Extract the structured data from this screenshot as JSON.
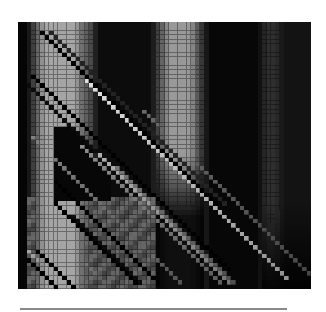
{
  "chart_data": {
    "type": "heatmap",
    "title": "",
    "xlabel": "",
    "ylabel": "",
    "colormap": "grayscale",
    "color_low": "#000000",
    "color_high": "#ffffff",
    "rows": 61,
    "cols": 66,
    "value_range": [
      0,
      1
    ],
    "column_bands": [
      {
        "col_start": 0,
        "col_end": 2,
        "value": 0.02
      },
      {
        "col_start": 3,
        "col_end": 4,
        "value": 0.35
      },
      {
        "col_start": 5,
        "col_end": 13,
        "value": 0.7
      },
      {
        "col_start": 14,
        "col_end": 16,
        "value": 0.4
      },
      {
        "col_start": 17,
        "col_end": 30,
        "value": 0.05
      },
      {
        "col_start": 31,
        "col_end": 32,
        "value": 0.35
      },
      {
        "col_start": 33,
        "col_end": 39,
        "value": 0.65
      },
      {
        "col_start": 40,
        "col_end": 41,
        "value": 0.3
      },
      {
        "col_start": 42,
        "col_end": 54,
        "value": 0.03
      },
      {
        "col_start": 55,
        "col_end": 58,
        "value": 0.2
      },
      {
        "col_start": 59,
        "col_end": 65,
        "value": 0.08
      }
    ],
    "band_fade": [
      {
        "col_start": 31,
        "col_end": 41,
        "fade_from_row": 30,
        "fade_to_row": 44
      },
      {
        "col_start": 55,
        "col_end": 65,
        "fade_from_row": 40,
        "fade_to_row": 60
      }
    ],
    "dark_wedge": {
      "row_start": 24,
      "row_end": 40,
      "col_start": 8,
      "col_end": 20,
      "value": 0.03
    },
    "lower_left_fill": {
      "row_start": 40,
      "row_end": 60,
      "col_start": 2,
      "col_end": 30,
      "value": 0.45
    },
    "diagonals": [
      {
        "row_start": 2,
        "col_start": 5,
        "length": 40,
        "value": 0.0,
        "style": "dark-checker"
      },
      {
        "row_start": 2,
        "col_start": 7,
        "length": 40,
        "value": 0.15,
        "style": "dark-checker"
      },
      {
        "row_start": 12,
        "col_start": 3,
        "length": 45,
        "value": 0.0,
        "style": "dark-checker"
      },
      {
        "row_start": 14,
        "col_start": 2,
        "length": 46,
        "value": 0.05,
        "style": "dark-checker"
      },
      {
        "row_start": 13,
        "col_start": 15,
        "length": 46,
        "value": 0.95,
        "style": "bright"
      },
      {
        "row_start": 15,
        "col_start": 17,
        "length": 44,
        "value": 0.55,
        "style": "bright"
      },
      {
        "row_start": 20,
        "col_start": 28,
        "length": 40,
        "value": 0.45,
        "style": "bright"
      },
      {
        "row_start": 26,
        "col_start": 3,
        "length": 34,
        "value": 0.55,
        "style": "bright"
      },
      {
        "row_start": 28,
        "col_start": 14,
        "length": 32,
        "value": 0.6,
        "style": "bright"
      },
      {
        "row_start": 30,
        "col_start": 18,
        "length": 30,
        "value": 0.75,
        "style": "bright"
      },
      {
        "row_start": 33,
        "col_start": 22,
        "length": 27,
        "value": 0.5,
        "style": "bright"
      },
      {
        "row_start": 36,
        "col_start": 8,
        "length": 24,
        "value": 0.0,
        "style": "dark-checker"
      },
      {
        "row_start": 41,
        "col_start": 8,
        "length": 19,
        "value": 0.0,
        "style": "dark-checker"
      },
      {
        "row_start": 44,
        "col_start": 12,
        "length": 16,
        "value": 0.05,
        "style": "dark-checker"
      },
      {
        "row_start": 52,
        "col_start": 2,
        "length": 9,
        "value": 0.7,
        "style": "bright"
      },
      {
        "row_start": 52,
        "col_start": 4,
        "length": 9,
        "value": 0.0,
        "style": "dark-checker"
      },
      {
        "row_start": 54,
        "col_start": 2,
        "length": 7,
        "value": 0.0,
        "style": "dark-checker"
      },
      {
        "row_start": 55,
        "col_start": 15,
        "length": 6,
        "value": 0.5,
        "style": "bright"
      }
    ]
  },
  "baseline": {
    "color": "#8a8a8a"
  }
}
